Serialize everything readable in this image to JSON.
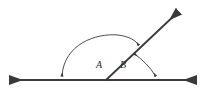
{
  "figure": {
    "kind": "geometry-diagram",
    "background_color": "#ffffff",
    "stroke_color": "#3a3a3a",
    "label_color": "#2b2b2b",
    "width": 208,
    "height": 94
  },
  "baseline": {
    "name": "horizontal-line",
    "y": 80,
    "x_start": 8,
    "x_end": 198,
    "arrow_start": true,
    "arrow_end": true,
    "stroke_width": 2.1
  },
  "ray": {
    "name": "oblique-ray",
    "vertex_x": 106,
    "vertex_y": 80,
    "tip_x": 180,
    "tip_y": 10,
    "arrow_end": true,
    "stroke_width": 1.8
  },
  "arcs": [
    {
      "name": "angle-A-arc",
      "label": "A",
      "start_x": 62,
      "start_y": 78,
      "end_x": 138,
      "end_y": 46,
      "peak_y": 34,
      "arrow_start": true,
      "arrow_end": true,
      "stroke_width": 0.9
    },
    {
      "name": "angle-B-arc",
      "label": "B",
      "start_x": 134,
      "start_y": 53,
      "end_x": 157,
      "end_y": 78,
      "arrow_start": true,
      "arrow_end": true,
      "stroke_width": 0.9
    }
  ],
  "labels": {
    "angle_a": "A",
    "angle_b": "B"
  }
}
